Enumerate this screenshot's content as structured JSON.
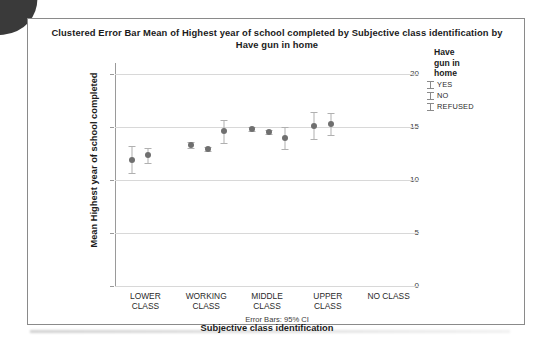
{
  "chart_data": {
    "type": "scatter",
    "title": "Clustered Error Bar Mean of Highest year of school completed by Subjective class identification by Have gun in home",
    "title_line1": "Clustered Error Bar Mean of Highest year of school completed by Subjective class identification by",
    "title_line2": "Have gun in home",
    "xlabel": "Subjective class identification",
    "ylabel": "Mean Highest year of school completed",
    "footnote": "Error Bars: 95% CI",
    "ylim": [
      0,
      21
    ],
    "yticks": [
      0,
      5,
      10,
      15,
      20
    ],
    "ytick_labels": [
      "0",
      "5",
      "10",
      "15",
      "20"
    ],
    "grid": true,
    "legend": {
      "title": "Have gun in home",
      "title_line1": "Have",
      "title_line2": "gun in",
      "title_line3": "home",
      "position": "right",
      "entries": [
        "YES",
        "NO",
        "REFUSED"
      ]
    },
    "categories": [
      "LOWER CLASS",
      "WORKING CLASS",
      "MIDDLE CLASS",
      "UPPER CLASS",
      "NO CLASS"
    ],
    "category_lines": [
      [
        "LOWER",
        "CLASS"
      ],
      [
        "WORKING",
        "CLASS"
      ],
      [
        "MIDDLE",
        "CLASS"
      ],
      [
        "UPPER",
        "CLASS"
      ],
      [
        "NO CLASS",
        ""
      ]
    ],
    "series": [
      {
        "name": "YES",
        "values": [
          11.9,
          13.3,
          14.8,
          15.1,
          null
        ],
        "ci_low": [
          10.6,
          13.0,
          14.6,
          13.8,
          null
        ],
        "ci_high": [
          13.2,
          13.6,
          15.0,
          16.4,
          null
        ]
      },
      {
        "name": "NO",
        "values": [
          12.3,
          12.9,
          14.5,
          15.3,
          null
        ],
        "ci_low": [
          11.6,
          12.7,
          14.3,
          14.2,
          null
        ],
        "ci_high": [
          13.0,
          13.1,
          14.7,
          16.3,
          null
        ]
      },
      {
        "name": "REFUSED",
        "values": [
          null,
          14.6,
          13.9,
          null,
          null
        ],
        "ci_low": [
          null,
          13.5,
          12.9,
          null,
          null
        ],
        "ci_high": [
          null,
          15.6,
          15.0,
          null,
          null
        ]
      }
    ],
    "points": [
      {
        "category": "LOWER CLASS",
        "group": "YES",
        "x_px": 0.055,
        "mean": 11.9,
        "low": 10.6,
        "high": 13.2
      },
      {
        "category": "LOWER CLASS",
        "group": "NO",
        "x_px": 0.11,
        "mean": 12.3,
        "low": 11.6,
        "high": 13.0
      },
      {
        "category": "WORKING CLASS",
        "group": "YES",
        "x_px": 0.25,
        "mean": 13.3,
        "low": 13.0,
        "high": 13.6
      },
      {
        "category": "WORKING CLASS",
        "group": "NO",
        "x_px": 0.305,
        "mean": 12.9,
        "low": 12.7,
        "high": 13.1
      },
      {
        "category": "WORKING CLASS",
        "group": "REFUSED",
        "x_px": 0.36,
        "mean": 14.6,
        "low": 13.5,
        "high": 15.6
      },
      {
        "category": "MIDDLE CLASS",
        "group": "YES",
        "x_px": 0.45,
        "mean": 14.8,
        "low": 14.6,
        "high": 15.0
      },
      {
        "category": "MIDDLE CLASS",
        "group": "NO",
        "x_px": 0.505,
        "mean": 14.5,
        "low": 14.3,
        "high": 14.7
      },
      {
        "category": "MIDDLE CLASS",
        "group": "REFUSED",
        "x_px": 0.56,
        "mean": 13.9,
        "low": 12.9,
        "high": 15.0
      },
      {
        "category": "UPPER CLASS",
        "group": "YES",
        "x_px": 0.655,
        "mean": 15.1,
        "low": 13.8,
        "high": 16.4
      },
      {
        "category": "UPPER CLASS",
        "group": "NO",
        "x_px": 0.71,
        "mean": 15.3,
        "low": 14.2,
        "high": 16.3
      }
    ],
    "colors": {
      "marker": "#6f6f6f",
      "errorbar": "#b0b0b0",
      "gridline": "#d8d8d8",
      "axis": "#9a9a9a",
      "frame": "#8a8a8a",
      "text": "#1b1b1b"
    }
  }
}
